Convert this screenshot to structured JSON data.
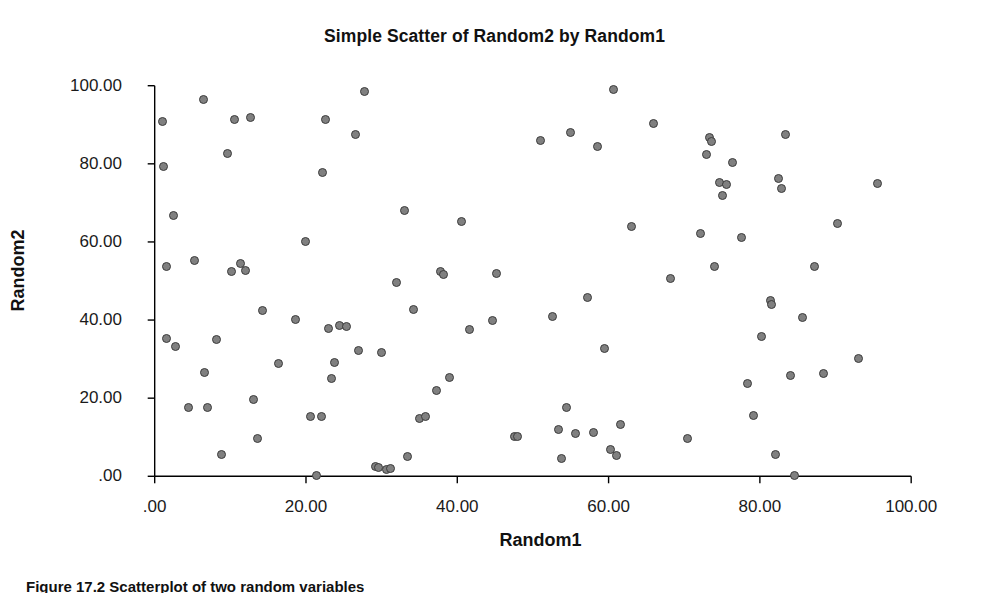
{
  "chart_data": {
    "type": "scatter",
    "title": "Simple Scatter of Random2 by Random1",
    "xlabel": "Random1",
    "ylabel": "Random2",
    "xlim": [
      -3,
      105
    ],
    "ylim": [
      -3,
      103
    ],
    "grid": false,
    "legend": null,
    "marker": {
      "shape": "circle",
      "fill_color": "#808080",
      "edge_color": "#3c3c3c",
      "size_px": 9
    },
    "xticks": [
      0,
      20,
      40,
      60,
      80,
      100
    ],
    "yticks": [
      0,
      20,
      40,
      60,
      80,
      100
    ],
    "xtick_labels": [
      ".00",
      "20.00",
      "40.00",
      "60.00",
      "80.00",
      "100.00"
    ],
    "ytick_labels": [
      ".00",
      "20.00",
      "40.00",
      "60.00",
      "80.00",
      "100.00"
    ],
    "n_points": 104,
    "points": [
      [
        1.0,
        90.8
      ],
      [
        1.2,
        79.4
      ],
      [
        1.5,
        53.6
      ],
      [
        1.6,
        35.2
      ],
      [
        2.5,
        66.8
      ],
      [
        2.8,
        33.2
      ],
      [
        4.5,
        17.6
      ],
      [
        5.2,
        55.2
      ],
      [
        6.4,
        96.4
      ],
      [
        6.6,
        26.6
      ],
      [
        7.0,
        17.5
      ],
      [
        8.2,
        35.0
      ],
      [
        8.8,
        5.6
      ],
      [
        9.6,
        82.6
      ],
      [
        10.2,
        52.4
      ],
      [
        10.6,
        91.3
      ],
      [
        11.4,
        54.6
      ],
      [
        12.6,
        91.8
      ],
      [
        13.0,
        19.6
      ],
      [
        13.6,
        9.6
      ],
      [
        14.2,
        42.4
      ],
      [
        16.4,
        28.8
      ],
      [
        18.6,
        40.2
      ],
      [
        20.0,
        60.0
      ],
      [
        20.6,
        15.2
      ],
      [
        21.4,
        0.2
      ],
      [
        22.2,
        77.8
      ],
      [
        22.6,
        91.4
      ],
      [
        23.0,
        37.8
      ],
      [
        23.4,
        25.0
      ],
      [
        23.8,
        29.2
      ],
      [
        24.4,
        38.6
      ],
      [
        25.4,
        38.4
      ],
      [
        26.6,
        87.4
      ],
      [
        27.0,
        32.3
      ],
      [
        27.8,
        98.4
      ],
      [
        29.2,
        2.6
      ],
      [
        30.0,
        31.6
      ],
      [
        30.6,
        1.8
      ],
      [
        31.2,
        2.0
      ],
      [
        32.0,
        49.6
      ],
      [
        33.0,
        68.0
      ],
      [
        33.4,
        5.0
      ],
      [
        34.2,
        42.8
      ],
      [
        35.0,
        14.8
      ],
      [
        35.8,
        15.2
      ],
      [
        37.2,
        22.0
      ],
      [
        37.8,
        52.4
      ],
      [
        38.2,
        51.6
      ],
      [
        39.0,
        25.4
      ],
      [
        40.6,
        65.2
      ],
      [
        41.6,
        37.6
      ],
      [
        44.6,
        40.0
      ],
      [
        45.2,
        52.0
      ],
      [
        47.6,
        10.2
      ],
      [
        51.0,
        86.0
      ],
      [
        52.6,
        41.0
      ],
      [
        53.4,
        12.0
      ],
      [
        53.8,
        4.6
      ],
      [
        54.4,
        17.6
      ],
      [
        55.0,
        88.0
      ],
      [
        55.6,
        11.0
      ],
      [
        57.2,
        45.8
      ],
      [
        58.6,
        84.4
      ],
      [
        59.4,
        32.6
      ],
      [
        60.2,
        6.8
      ],
      [
        60.6,
        99.0
      ],
      [
        61.0,
        5.4
      ],
      [
        61.6,
        13.2
      ],
      [
        63.0,
        63.9
      ],
      [
        66.0,
        90.4
      ],
      [
        68.2,
        50.6
      ],
      [
        70.4,
        9.8
      ],
      [
        72.2,
        62.2
      ],
      [
        73.0,
        82.4
      ],
      [
        73.4,
        86.8
      ],
      [
        73.6,
        85.6
      ],
      [
        74.0,
        53.8
      ],
      [
        74.6,
        75.2
      ],
      [
        75.0,
        72.0
      ],
      [
        75.6,
        74.6
      ],
      [
        76.4,
        80.4
      ],
      [
        77.6,
        61.2
      ],
      [
        78.4,
        23.8
      ],
      [
        79.2,
        15.6
      ],
      [
        80.2,
        35.8
      ],
      [
        81.4,
        45.0
      ],
      [
        81.6,
        44.0
      ],
      [
        82.0,
        5.6
      ],
      [
        82.4,
        76.2
      ],
      [
        82.8,
        73.8
      ],
      [
        83.4,
        87.4
      ],
      [
        84.0,
        25.8
      ],
      [
        84.6,
        0.2
      ],
      [
        85.6,
        40.6
      ],
      [
        87.2,
        53.8
      ],
      [
        88.4,
        26.2
      ],
      [
        90.2,
        64.6
      ],
      [
        93.0,
        30.2
      ],
      [
        95.6,
        75.0
      ],
      [
        48.0,
        10.2
      ],
      [
        12.0,
        52.6
      ],
      [
        22.0,
        15.2
      ],
      [
        29.6,
        2.2
      ],
      [
        58.0,
        11.2
      ]
    ]
  },
  "caption": {
    "text": "Figure 17.2  Scatterplot of two random variables"
  }
}
